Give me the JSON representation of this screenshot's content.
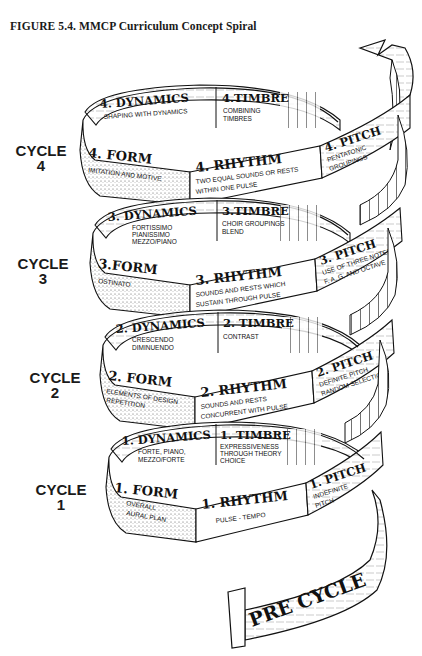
{
  "figure": {
    "title": "FIGURE 5.4.  MMCP Curriculum Concept Spiral"
  },
  "cycles": [
    {
      "label_line1": "CYCLE",
      "label_line2": "4",
      "dynamics": {
        "heading": "4. DYNAMICS",
        "lines": [
          "SHAPING WITH DYNAMICS"
        ]
      },
      "timbre": {
        "heading": "4.TIMBRE",
        "lines": [
          "COMBINING",
          "TIMBRES"
        ]
      },
      "form": {
        "heading": "4. FORM",
        "lines": [
          "IMITATION AND MOTIVE"
        ]
      },
      "rhythm": {
        "heading": "4. RHYTHM",
        "lines": [
          "TWO EQUAL SOUNDS OR RESTS",
          "WITHIN ONE PULSE"
        ]
      },
      "pitch": {
        "heading": "4. PITCH",
        "lines": [
          "PENTATONIC",
          "GROUPINGS"
        ]
      }
    },
    {
      "label_line1": "CYCLE",
      "label_line2": "3",
      "dynamics": {
        "heading": "3. DYNAMICS",
        "lines": [
          "FORTISSIMO",
          "PIANISSIMO",
          "MEZZO/PIANO"
        ]
      },
      "timbre": {
        "heading": "3.TIMBRE",
        "lines": [
          "CHOIR GROUPINGS",
          "BLEND"
        ]
      },
      "form": {
        "heading": "3.FORM",
        "lines": [
          "OSTINATO"
        ]
      },
      "rhythm": {
        "heading": "3. RHYTHM",
        "lines": [
          "SOUNDS AND RESTS WHICH",
          "SUSTAIN THROUGH PULSE"
        ]
      },
      "pitch": {
        "heading": "3. PITCH",
        "lines": [
          "USE OF THREE NOTES",
          "F, A, G, AND OCTAVE"
        ]
      }
    },
    {
      "label_line1": "CYCLE",
      "label_line2": "2",
      "dynamics": {
        "heading": "2. DYNAMICS",
        "lines": [
          "CRESCENDO",
          "DIMINUENDO"
        ]
      },
      "timbre": {
        "heading": "2. TIMBRE",
        "lines": [
          "CONTRAST"
        ]
      },
      "form": {
        "heading": "2. FORM",
        "lines": [
          "ELEMENTS OF DESIGN",
          "REPETITION"
        ]
      },
      "rhythm": {
        "heading": "2. RHYTHM",
        "lines": [
          "SOUNDS AND RESTS",
          "CONCURRENT WITH PULSE"
        ]
      },
      "pitch": {
        "heading": "2. PITCH",
        "lines": [
          "DEFINITE PITCH",
          "RANDOM SELECTION"
        ]
      }
    },
    {
      "label_line1": "CYCLE",
      "label_line2": "1",
      "dynamics": {
        "heading": "1. DYNAMICS",
        "lines": [
          "FORTE, PIANO,",
          "MEZZO/FORTE"
        ]
      },
      "timbre": {
        "heading": "1. TIMBRE",
        "lines": [
          "EXPRESSIVENESS",
          "THROUGH THEORY",
          "CHOICE"
        ]
      },
      "form": {
        "heading": "1. FORM",
        "lines": [
          "OVERALL",
          "AURAL PLAN"
        ]
      },
      "rhythm": {
        "heading": "1. RHYTHM",
        "lines": [
          "PULSE - TEMPO"
        ]
      },
      "pitch": {
        "heading": "1. PITCH",
        "lines": [
          "INDEFINITE",
          "PITCH"
        ]
      }
    }
  ],
  "pre_cycle": {
    "label": "PRE CYCLE"
  },
  "colors": {
    "ink": "#111111",
    "paper": "#ffffff",
    "stipple": "#d9d9d9"
  }
}
